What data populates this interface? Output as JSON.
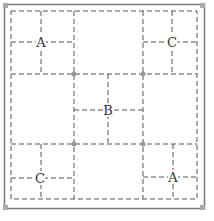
{
  "diagram": {
    "labels": {
      "top_left": "A",
      "top_right": "C",
      "center": "B",
      "bottom_left": "C",
      "bottom_right": "A"
    },
    "colors": {
      "outer_border": "#777777",
      "dashed_lines": "#555555",
      "dots": "#999999"
    }
  }
}
